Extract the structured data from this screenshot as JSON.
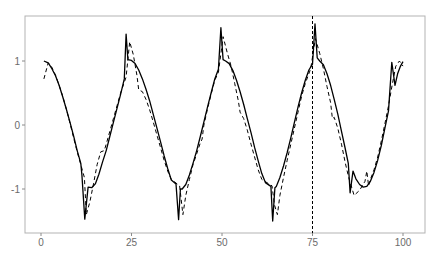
{
  "chart_data": {
    "type": "line",
    "title": "",
    "xlabel": "",
    "ylabel": "",
    "xlim": [
      -3,
      106
    ],
    "ylim": [
      -1.68,
      1.71
    ],
    "grid": false,
    "legend": null,
    "x_ticks": [
      0,
      25,
      50,
      75,
      100
    ],
    "y_ticks": [
      -1,
      0,
      1
    ],
    "annotations": [
      {
        "type": "vline",
        "x": 75,
        "style": "dashed"
      }
    ],
    "series": [
      {
        "name": "solid",
        "style": "solid",
        "points": [
          [
            0.8,
            1.0
          ],
          [
            2,
            0.97
          ],
          [
            3,
            0.88
          ],
          [
            4,
            0.77
          ],
          [
            5,
            0.62
          ],
          [
            6,
            0.44
          ],
          [
            7,
            0.25
          ],
          [
            8,
            0.04
          ],
          [
            9,
            -0.17
          ],
          [
            10,
            -0.4
          ],
          [
            11,
            -0.6
          ],
          [
            11.3,
            -0.78
          ],
          [
            12.1,
            -1.47
          ],
          [
            13,
            -0.97
          ],
          [
            14,
            -0.98
          ],
          [
            15,
            -0.92
          ],
          [
            16,
            -0.77
          ],
          [
            17,
            -0.58
          ],
          [
            18,
            -0.4
          ],
          [
            19,
            -0.18
          ],
          [
            20,
            0.04
          ],
          [
            21,
            0.26
          ],
          [
            22,
            0.48
          ],
          [
            23,
            0.72
          ],
          [
            23.5,
            1.42
          ],
          [
            24,
            1.02
          ],
          [
            25,
            1.01
          ],
          [
            26,
            0.96
          ],
          [
            27,
            0.86
          ],
          [
            28,
            0.72
          ],
          [
            29,
            0.56
          ],
          [
            30,
            0.38
          ],
          [
            31,
            0.17
          ],
          [
            32,
            -0.04
          ],
          [
            33,
            -0.26
          ],
          [
            34,
            -0.48
          ],
          [
            35,
            -0.68
          ],
          [
            36,
            -0.86
          ],
          [
            37.3,
            -0.92
          ],
          [
            38,
            -1.48
          ],
          [
            38.5,
            -1.0
          ],
          [
            39,
            -1.0
          ],
          [
            40,
            -0.93
          ],
          [
            41,
            -0.78
          ],
          [
            42,
            -0.6
          ],
          [
            43,
            -0.4
          ],
          [
            44,
            -0.18
          ],
          [
            45,
            0.05
          ],
          [
            46,
            0.28
          ],
          [
            47,
            0.5
          ],
          [
            48,
            0.72
          ],
          [
            49,
            0.87
          ],
          [
            49.7,
            1.52
          ],
          [
            50.3,
            1.02
          ],
          [
            51,
            1.0
          ],
          [
            52,
            0.96
          ],
          [
            53,
            0.85
          ],
          [
            54,
            0.7
          ],
          [
            55,
            0.52
          ],
          [
            56,
            0.32
          ],
          [
            57,
            0.1
          ],
          [
            58,
            -0.12
          ],
          [
            59,
            -0.35
          ],
          [
            60,
            -0.56
          ],
          [
            61,
            -0.76
          ],
          [
            62,
            -0.9
          ],
          [
            63.5,
            -0.96
          ],
          [
            64,
            -1.5
          ],
          [
            64.6,
            -0.98
          ],
          [
            65,
            -0.96
          ],
          [
            66,
            -0.82
          ],
          [
            67,
            -0.64
          ],
          [
            68,
            -0.43
          ],
          [
            69,
            -0.2
          ],
          [
            70,
            0.04
          ],
          [
            71,
            0.28
          ],
          [
            72,
            0.5
          ],
          [
            73,
            0.7
          ],
          [
            74,
            0.86
          ],
          [
            75,
            0.95
          ],
          [
            75.7,
            1.58
          ],
          [
            76.3,
            1.05
          ],
          [
            77,
            1.0
          ],
          [
            78,
            0.94
          ],
          [
            79,
            0.8
          ],
          [
            80,
            0.62
          ],
          [
            81,
            0.4
          ],
          [
            82,
            0.17
          ],
          [
            83,
            -0.1
          ],
          [
            84,
            -0.36
          ],
          [
            84.9,
            -0.6
          ],
          [
            85.4,
            -1.06
          ],
          [
            86.2,
            -0.72
          ],
          [
            87,
            -0.84
          ],
          [
            88,
            -0.93
          ],
          [
            89,
            -0.97
          ],
          [
            90,
            -0.96
          ],
          [
            91,
            -0.88
          ],
          [
            92,
            -0.74
          ],
          [
            93,
            -0.55
          ],
          [
            94,
            -0.32
          ],
          [
            95,
            -0.05
          ],
          [
            96,
            0.22
          ],
          [
            96.9,
            0.98
          ],
          [
            97.8,
            0.62
          ],
          [
            98.5,
            0.8
          ],
          [
            99.3,
            0.92
          ],
          [
            100,
            0.99
          ]
        ]
      },
      {
        "name": "dashed",
        "style": "dashed",
        "points": [
          [
            0.8,
            0.72
          ],
          [
            2,
            0.97
          ],
          [
            3,
            0.9
          ],
          [
            4,
            0.78
          ],
          [
            5,
            0.62
          ],
          [
            6,
            0.45
          ],
          [
            7,
            0.25
          ],
          [
            8,
            0.03
          ],
          [
            9,
            -0.2
          ],
          [
            10,
            -0.42
          ],
          [
            11,
            -0.62
          ],
          [
            12,
            -0.82
          ],
          [
            12.5,
            -1.4
          ],
          [
            13.5,
            -1.2
          ],
          [
            14.5,
            -0.92
          ],
          [
            15.5,
            -0.62
          ],
          [
            16.5,
            -0.42
          ],
          [
            17.5,
            -0.4
          ],
          [
            18,
            -0.3
          ],
          [
            19,
            -0.1
          ],
          [
            20,
            0.1
          ],
          [
            21,
            0.3
          ],
          [
            22,
            0.5
          ],
          [
            23.5,
            0.75
          ],
          [
            24.5,
            1.3
          ],
          [
            25.5,
            1.1
          ],
          [
            26.5,
            0.78
          ],
          [
            27,
            0.55
          ],
          [
            28,
            0.52
          ],
          [
            29,
            0.4
          ],
          [
            30,
            0.24
          ],
          [
            31,
            0.05
          ],
          [
            32,
            -0.15
          ],
          [
            33,
            -0.35
          ],
          [
            34,
            -0.55
          ],
          [
            35,
            -0.72
          ],
          [
            36,
            -0.85
          ],
          [
            38.3,
            -0.95
          ],
          [
            39.2,
            -1.4
          ],
          [
            40,
            -1.1
          ],
          [
            41,
            -0.85
          ],
          [
            42,
            -0.62
          ],
          [
            43,
            -0.45
          ],
          [
            44,
            -0.28
          ],
          [
            44.5,
            -0.22
          ],
          [
            45,
            0.0
          ],
          [
            46,
            0.25
          ],
          [
            47,
            0.48
          ],
          [
            48,
            0.7
          ],
          [
            49,
            0.82
          ],
          [
            50.3,
            1.38
          ],
          [
            51.5,
            1.12
          ],
          [
            52.5,
            0.92
          ],
          [
            53.5,
            0.65
          ],
          [
            54.5,
            0.38
          ],
          [
            55,
            0.2
          ],
          [
            56,
            0.1
          ],
          [
            57,
            -0.08
          ],
          [
            58,
            -0.3
          ],
          [
            59,
            -0.5
          ],
          [
            60,
            -0.7
          ],
          [
            61,
            -0.85
          ],
          [
            63.8,
            -0.95
          ],
          [
            64.5,
            -1.25
          ],
          [
            65.3,
            -1.4
          ],
          [
            66,
            -1.1
          ],
          [
            67,
            -0.82
          ],
          [
            68,
            -0.55
          ],
          [
            69,
            -0.3
          ],
          [
            70,
            -0.05
          ],
          [
            71,
            0.2
          ],
          [
            72,
            0.45
          ],
          [
            73,
            0.65
          ],
          [
            74.5,
            0.88
          ],
          [
            75.8,
            1.35
          ],
          [
            77,
            1.12
          ],
          [
            78,
            0.88
          ],
          [
            79,
            0.6
          ],
          [
            80,
            0.35
          ],
          [
            80.5,
            0.1
          ],
          [
            81,
            0.12
          ],
          [
            82,
            -0.05
          ],
          [
            83,
            -0.3
          ],
          [
            84,
            -0.58
          ],
          [
            85,
            -0.82
          ],
          [
            86.5,
            -1.1
          ],
          [
            88,
            -1.02
          ],
          [
            89.5,
            -0.88
          ],
          [
            90,
            -0.72
          ],
          [
            90.5,
            -0.95
          ],
          [
            91,
            -0.85
          ],
          [
            92,
            -0.7
          ],
          [
            93,
            -0.5
          ],
          [
            94,
            -0.25
          ],
          [
            95,
            0.02
          ],
          [
            96,
            0.3
          ],
          [
            97,
            0.62
          ],
          [
            98,
            0.92
          ],
          [
            99,
            1.0
          ],
          [
            100,
            0.92
          ]
        ]
      }
    ]
  },
  "axis": {
    "x_tick_labels": [
      "0",
      "25",
      "50",
      "75",
      "100"
    ],
    "y_tick_labels": [
      "-1",
      "0",
      "1"
    ]
  }
}
